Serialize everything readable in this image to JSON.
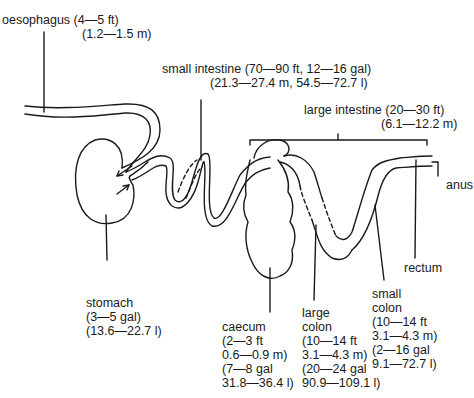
{
  "figure": {
    "type": "equine digestive tract diagram",
    "labels": {
      "oesophagus": {
        "name": "oesophagus (4—5 ft)",
        "metric": "(1.2—1.5 m)"
      },
      "small_intestine": {
        "name": "small intestine (70—90 ft, 12—16 gal)",
        "metric": "(21.3—27.4 m, 54.5—72.7 l)"
      },
      "large_intestine": {
        "name": "large intestine (20—30 ft)",
        "metric": "(6.1—12.2 m)"
      },
      "anus": {
        "name": "anus"
      },
      "rectum": {
        "name": "rectum"
      },
      "stomach": {
        "lines": [
          "stomach",
          "(3—5 gal)",
          "(13.6—22.7 l)"
        ]
      },
      "caecum": {
        "lines": [
          "caecum",
          "(2—3 ft",
          "0.6—0.9 m)",
          "(7—8 gal",
          "31.8—36.4 l)"
        ]
      },
      "large_colon": {
        "lines": [
          "large",
          "colon",
          "(10—14 ft",
          "3.1—4.3 m)",
          "(20—24 gal",
          "90.9—109.1 l)"
        ]
      },
      "small_colon": {
        "lines": [
          "small",
          "colon",
          "(10—14 ft",
          "3.1—4.3 m)",
          "(2—16 gal",
          "9.1—72.7 l)"
        ]
      }
    }
  }
}
